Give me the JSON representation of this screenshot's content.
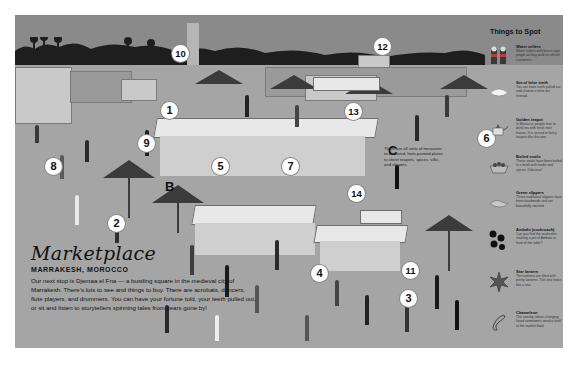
{
  "intro": {
    "title": "Marketplace",
    "subtitle": "MARRAKESH, MOROCCO",
    "body": "Our next stop is Djemaa el Fna — a bustling square in the medieval city of Marrakesh. There's lots to see and things to buy. There are acrobats, dancers, flute players, and drummers. You can have your fortune told, your teeth pulled out, or sit and listen to storytellers spinning tales from years gone by!"
  },
  "measure_note": "There are all sorts of measures to be found, from painted plates to sheet teapots, spices, silks, and slippers.",
  "things_to_spot": {
    "title": "Things to Spot",
    "items": [
      {
        "name": "Water sellers",
        "desc": "Water sellers with brass cups jangle as they walk to refresh customers.",
        "icon": "water-sellers-icon"
      },
      {
        "name": "Set of false teeth",
        "desc": "You can have teeth pulled out and choose a false set instead.",
        "icon": "false-teeth-icon"
      },
      {
        "name": "Golden teapot",
        "desc": "In Morocco, people love to drink tea with fresh mint leaves. It is served in fancy teapots like this one.",
        "icon": "golden-teapot-icon"
      },
      {
        "name": "Boiled snails",
        "desc": "These snails have been boiled in a broth with herbs and spices. Delicious!",
        "icon": "boiled-snails-icon"
      },
      {
        "name": "Green slippers",
        "desc": "These traditional slippers have been handmade and are beautifully stitched.",
        "icon": "green-slippers-icon"
      },
      {
        "name": "Ambalo (cockroach)",
        "desc": "Can you find the snakeskin shaking a pot of Ambalo in front of the table?",
        "icon": "ambalo-icon"
      },
      {
        "name": "Star lantern",
        "desc": "The lanterns are lifted with pretty lanterns. This one looks like a star.",
        "icon": "star-lantern-icon"
      },
      {
        "name": "Chameleon",
        "desc": "The sneaky colour-changing lizard sometimes sneaks itself to the market food.",
        "icon": "chameleon-icon"
      }
    ]
  },
  "markers": [
    {
      "label": "1",
      "x": 146,
      "y": 87
    },
    {
      "label": "2",
      "x": 93,
      "y": 200
    },
    {
      "label": "3",
      "x": 385,
      "y": 275
    },
    {
      "label": "4",
      "x": 296,
      "y": 250
    },
    {
      "label": "5",
      "x": 197,
      "y": 143
    },
    {
      "label": "6",
      "x": 463,
      "y": 115
    },
    {
      "label": "7",
      "x": 267,
      "y": 143
    },
    {
      "label": "8",
      "x": 30,
      "y": 143
    },
    {
      "label": "9",
      "x": 123,
      "y": 120
    },
    {
      "label": "10",
      "x": 157,
      "y": 30
    },
    {
      "label": "11",
      "x": 387,
      "y": 247
    },
    {
      "label": "12",
      "x": 359,
      "y": 23
    },
    {
      "label": "13",
      "x": 330,
      "y": 88
    },
    {
      "label": "14",
      "x": 333,
      "y": 170
    }
  ],
  "letters": [
    {
      "label": "B",
      "x": 150,
      "y": 164
    },
    {
      "label": "C",
      "x": 373,
      "y": 128
    }
  ],
  "colors": {
    "background": "#a3a3a3",
    "sky": "#8a8a8a",
    "marker_fill": "#ffffff",
    "text": "#111111"
  }
}
